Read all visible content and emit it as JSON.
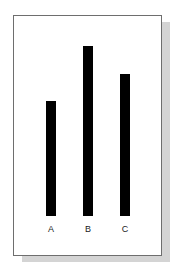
{
  "chart_data": {
    "type": "bar",
    "title": "",
    "xlabel": "",
    "ylabel": "",
    "categories": [
      "A",
      "B",
      "C"
    ],
    "values": [
      115,
      170,
      142
    ],
    "value_units": "relative bar height (no axis shown)",
    "axis_visible": false,
    "grid": false,
    "legend": null,
    "bar_color": "#000000"
  },
  "bars": [
    {
      "label": "A",
      "height": 115,
      "left": 46
    },
    {
      "label": "B",
      "height": 170,
      "left": 83
    },
    {
      "label": "C",
      "height": 142,
      "left": 120
    }
  ],
  "layout": {
    "baseline_y": 216
  }
}
